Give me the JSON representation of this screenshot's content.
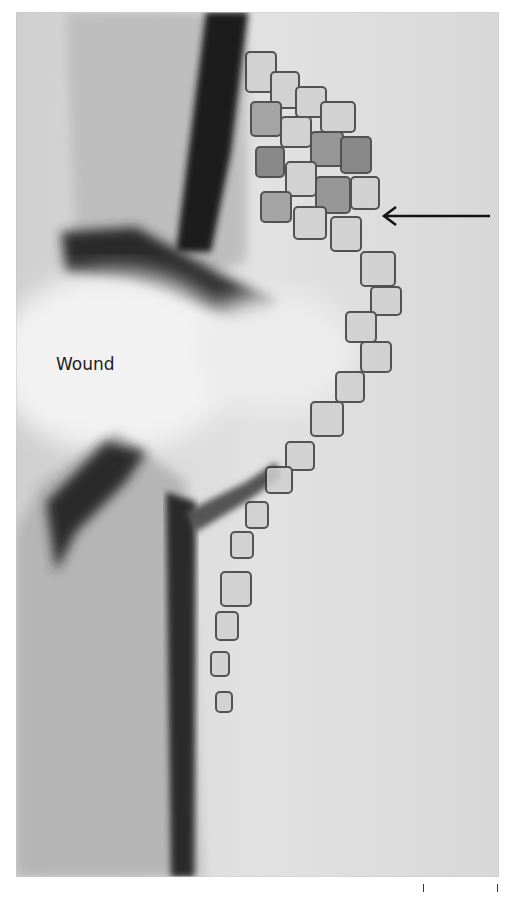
{
  "figure": {
    "annotation_label": "Wound",
    "arrow_direction": "left",
    "arrow_icon": "left-arrow-icon",
    "colors": {
      "background": "#dcdcdc",
      "dark_tissue": "#1a1a1a",
      "cell_outline": "#3a3a3a",
      "page": "#ffffff"
    },
    "scale_ticks": 2
  }
}
